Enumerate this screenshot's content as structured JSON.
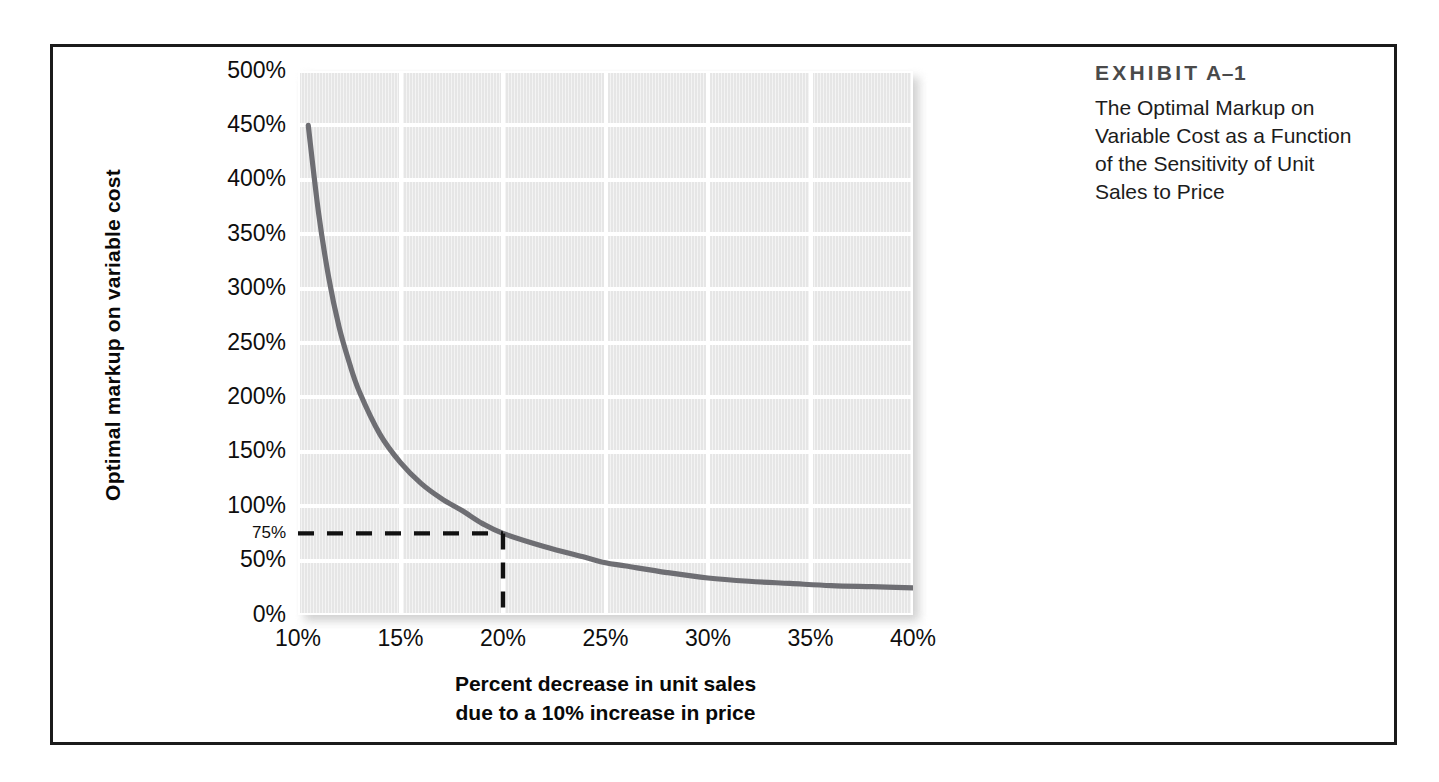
{
  "figure": {
    "exhibit_label_main": "EXHIBIT",
    "exhibit_label_number": "A–1",
    "caption_lines": [
      "The Optimal Markup on",
      "Variable Cost as a Function",
      "of the Sensitivity of Unit",
      "Sales to Price"
    ]
  },
  "colors": {
    "frame_border": "#1b1b1b",
    "plot_background": "#e6e6e6",
    "gridline": "#ffffff",
    "curve": "#6e6e73",
    "guide_dash": "#111111",
    "exhibit_label": "#4a4a4a",
    "tick_text": "#0e0e0e"
  },
  "chart_data": {
    "type": "line",
    "xlabel": "Percent decrease in unit sales due to a 10% increase in price",
    "ylabel": "Optimal markup on variable cost",
    "xlabel_lines": [
      "Percent decrease in unit sales",
      "due to a 10% increase in price"
    ],
    "xlim": [
      10,
      40
    ],
    "ylim": [
      0,
      500
    ],
    "grid": true,
    "legend": "none",
    "xticks": [
      10,
      15,
      20,
      25,
      30,
      35,
      40
    ],
    "xtick_labels": [
      "10%",
      "15%",
      "20%",
      "25%",
      "30%",
      "35%",
      "40%"
    ],
    "yticks": [
      0,
      50,
      75,
      100,
      150,
      200,
      250,
      300,
      350,
      400,
      450,
      500
    ],
    "ytick_labels": [
      "0%",
      "50%",
      "75%",
      "100%",
      "150%",
      "200%",
      "250%",
      "300%",
      "350%",
      "400%",
      "450%",
      "500%"
    ],
    "ygridlines": [
      0,
      50,
      100,
      150,
      200,
      250,
      300,
      350,
      400,
      450,
      500
    ],
    "x": [
      10.5,
      11,
      11.5,
      12,
      12.5,
      13,
      14,
      15,
      16,
      17,
      18,
      19,
      20,
      22,
      24,
      25,
      26,
      28,
      30,
      32,
      34,
      36,
      38,
      40
    ],
    "y": [
      450,
      370,
      310,
      265,
      232,
      205,
      166,
      140,
      121,
      107,
      96,
      84,
      75,
      63,
      53,
      48,
      45,
      39,
      34,
      31,
      29,
      27,
      26,
      25
    ],
    "annotations": [
      {
        "name": "optimal-markup-guide",
        "type": "dashed-crosshair",
        "x": 20,
        "y": 75,
        "x_label": "20%",
        "y_label": "75%"
      }
    ]
  }
}
